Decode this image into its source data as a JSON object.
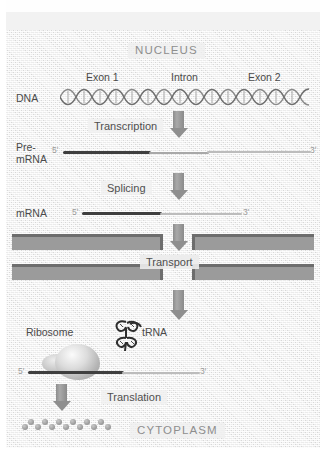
{
  "figure": {
    "regions": {
      "nucleus_label": "NUCLEUS",
      "cytoplasm_label": "CYTOPLASM"
    },
    "gene_parts": {
      "exon1": "Exon 1",
      "intron": "Intron",
      "exon2": "Exon 2"
    },
    "molecules": {
      "dna": "DNA",
      "pre_mrna_line1": "Pre-",
      "pre_mrna_line2": "mRNA",
      "mrna": "mRNA",
      "trna": "tRNA",
      "ribosome": "Ribosome"
    },
    "stages": {
      "transcription": "Transcription",
      "splicing": "Splicing",
      "transport": "Transport",
      "translation": "Translation"
    },
    "strand_ends": {
      "five_prime": "5'",
      "three_prime": "3'"
    },
    "colors": {
      "background": "#ebebeb",
      "exon_strand": "#3f3f3f",
      "intron_strand": "#bcbcbc",
      "membrane": "#9b9b9b",
      "membrane_edge": "#6d6d6d",
      "arrow": "#8f8f8f",
      "region_text": "#8e8e8e",
      "label_text": "#4a4a4a"
    }
  }
}
